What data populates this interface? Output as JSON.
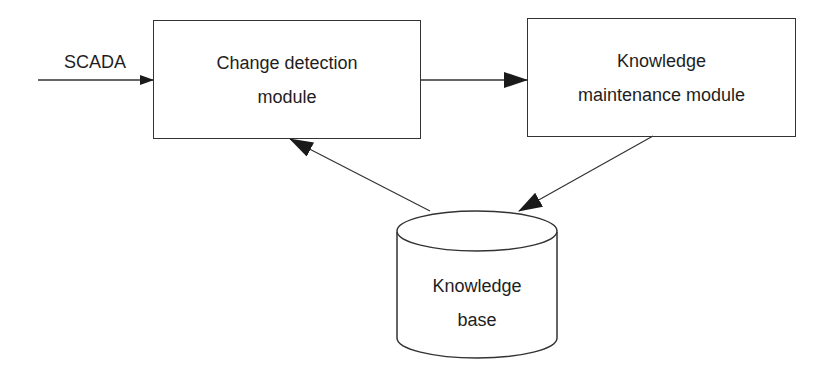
{
  "diagram": {
    "input": {
      "label": "SCADA"
    },
    "nodes": [
      {
        "id": "change-detection",
        "lines": [
          "Change detection",
          "module"
        ],
        "shape": "rectangle"
      },
      {
        "id": "knowledge-maintenance",
        "lines": [
          "Knowledge",
          "maintenance module"
        ],
        "shape": "rectangle"
      },
      {
        "id": "knowledge-base",
        "lines": [
          "Knowledge",
          "base"
        ],
        "shape": "cylinder"
      }
    ],
    "edges": [
      {
        "from": "SCADA",
        "to": "change-detection"
      },
      {
        "from": "change-detection",
        "to": "knowledge-maintenance"
      },
      {
        "from": "knowledge-maintenance",
        "to": "knowledge-base"
      },
      {
        "from": "knowledge-base",
        "to": "change-detection"
      }
    ],
    "colors": {
      "stroke": "#333333",
      "background": "#ffffff",
      "text": "#1e1e1e"
    }
  }
}
